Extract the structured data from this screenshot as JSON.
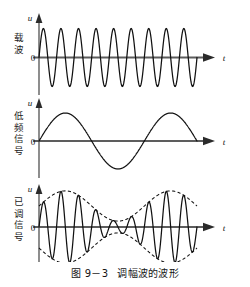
{
  "figure": {
    "caption_number": "图 9－3",
    "caption_title": "调幅波的波形",
    "panels": [
      {
        "id": "carrier",
        "label": "载波",
        "y_axis_label": "u",
        "x_axis_label": "t",
        "origin_label": "0",
        "description": "等幅高频载波正弦波"
      },
      {
        "id": "low-frequency-signal",
        "label": "低频信号",
        "y_axis_label": "u",
        "x_axis_label": "t",
        "origin_label": "0",
        "description": "低频调制正弦信号"
      },
      {
        "id": "modulated-signal",
        "label": "已调信号",
        "y_axis_label": "u",
        "x_axis_label": "t",
        "origin_label": "0",
        "description": "调幅已调波及其虚线包络"
      }
    ]
  },
  "chart_data": {
    "type": "line",
    "title": "调幅波的波形",
    "xlabel": "t",
    "ylabel": "u",
    "grid": false,
    "legend": null,
    "x_range": [
      0,
      1
    ],
    "panels": [
      {
        "name": "载波",
        "series": [
          {
            "name": "carrier",
            "kind": "sine",
            "amplitude": 1.0,
            "cycles": 9,
            "phase_deg": 0,
            "style": "solid",
            "color": "#111111",
            "ylim": [
              -1.15,
              1.15
            ]
          }
        ]
      },
      {
        "name": "低频信号",
        "series": [
          {
            "name": "modulating",
            "kind": "sine",
            "amplitude": 1.0,
            "cycles": 1.5,
            "phase_deg": 0,
            "style": "solid",
            "color": "#111111",
            "ylim": [
              -1.15,
              1.15
            ]
          }
        ]
      },
      {
        "name": "已调信号",
        "series": [
          {
            "name": "am-wave",
            "kind": "am",
            "carrier_cycles": 9,
            "modulating_cycles": 1.5,
            "modulation_index": 0.72,
            "carrier_amplitude": 1.0,
            "style": "solid",
            "color": "#111111",
            "ylim": [
              -1.25,
              1.25
            ]
          },
          {
            "name": "envelope-upper",
            "kind": "envelope",
            "sign": 1,
            "style": "dashed",
            "color": "#111111"
          },
          {
            "name": "envelope-lower",
            "kind": "envelope",
            "sign": -1,
            "style": "dashed",
            "color": "#111111"
          }
        ]
      }
    ]
  },
  "style": {
    "axis_color": "#5d5d5d",
    "curve_color": "#111111",
    "background": "#ffffff"
  }
}
